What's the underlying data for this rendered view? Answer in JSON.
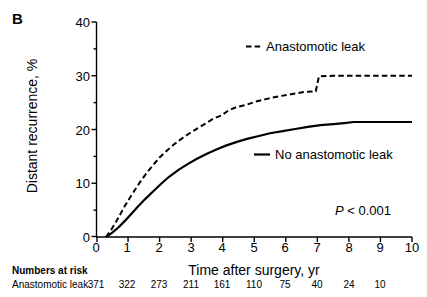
{
  "panel": {
    "label": "B"
  },
  "axes": {
    "ylabel": "Distant recurrence, %",
    "xlabel": "Time after surgery, yr",
    "yticks": [
      "0",
      "10",
      "20",
      "30",
      "40"
    ],
    "xticks": [
      "0",
      "1",
      "2",
      "3",
      "4",
      "5",
      "6",
      "7",
      "8",
      "9",
      "10"
    ]
  },
  "legend": {
    "dashed_label": "Anastomotic leak",
    "solid_label": "No anastomotic leak"
  },
  "stats": {
    "p_prefix": "P",
    "p_rest": " < 0.001"
  },
  "risk": {
    "title": "Numbers at risk",
    "row_label": "Anastomotic leak",
    "values": [
      "371",
      "322",
      "273",
      "211",
      "161",
      "110",
      "75",
      "40",
      "24",
      "10"
    ]
  },
  "colors": {
    "line": "#000000",
    "axis": "#000000",
    "background": "#ffffff"
  },
  "chart_data": {
    "type": "line",
    "title": "",
    "xlabel": "Time after surgery, yr",
    "ylabel": "Distant recurrence, %",
    "xlim": [
      0,
      10
    ],
    "ylim": [
      0,
      40
    ],
    "xticks": [
      0,
      1,
      2,
      3,
      4,
      5,
      6,
      7,
      8,
      9,
      10
    ],
    "yticks": [
      0,
      10,
      20,
      30,
      40
    ],
    "yminorticks": [
      5,
      15,
      25,
      35
    ],
    "grid": false,
    "legend_position": "inside",
    "annotations": [
      "P < 0.001"
    ],
    "series": [
      {
        "name": "Anastomotic leak",
        "style": "dashed",
        "x": [
          0.3,
          0.45,
          0.6,
          0.75,
          0.9,
          1.05,
          1.2,
          1.4,
          1.6,
          1.8,
          2.0,
          2.2,
          2.45,
          2.7,
          2.95,
          3.2,
          3.45,
          3.7,
          3.95,
          4.2,
          4.45,
          4.75,
          5.05,
          5.4,
          5.8,
          6.2,
          6.6,
          6.95,
          7.05,
          7.5,
          8.0,
          8.5,
          9.0,
          9.5,
          10.0
        ],
        "y": [
          0.0,
          1.2,
          2.6,
          4.2,
          5.8,
          7.2,
          8.6,
          10.4,
          12.0,
          13.4,
          14.8,
          15.9,
          17.2,
          18.3,
          19.3,
          20.2,
          21.1,
          22.0,
          22.6,
          23.6,
          24.2,
          24.6,
          25.2,
          25.7,
          26.2,
          26.6,
          27.0,
          27.1,
          29.9,
          30.0,
          30.0,
          30.0,
          30.0,
          30.0,
          30.0
        ]
      },
      {
        "name": "No anastomotic leak",
        "style": "solid",
        "x": [
          0.3,
          0.5,
          0.7,
          0.9,
          1.1,
          1.3,
          1.55,
          1.8,
          2.05,
          2.3,
          2.6,
          2.9,
          3.2,
          3.5,
          3.8,
          4.1,
          4.45,
          4.8,
          5.15,
          5.5,
          5.9,
          6.3,
          6.7,
          7.1,
          7.5,
          7.85,
          8.15,
          8.5,
          9.0,
          9.5,
          10.0
        ],
        "y": [
          0.0,
          0.8,
          1.8,
          3.0,
          4.3,
          5.6,
          7.1,
          8.5,
          9.9,
          11.2,
          12.5,
          13.6,
          14.6,
          15.5,
          16.3,
          17.0,
          17.7,
          18.3,
          18.8,
          19.3,
          19.7,
          20.1,
          20.5,
          20.8,
          21.0,
          21.2,
          21.4,
          21.4,
          21.4,
          21.4,
          21.4
        ]
      }
    ]
  }
}
